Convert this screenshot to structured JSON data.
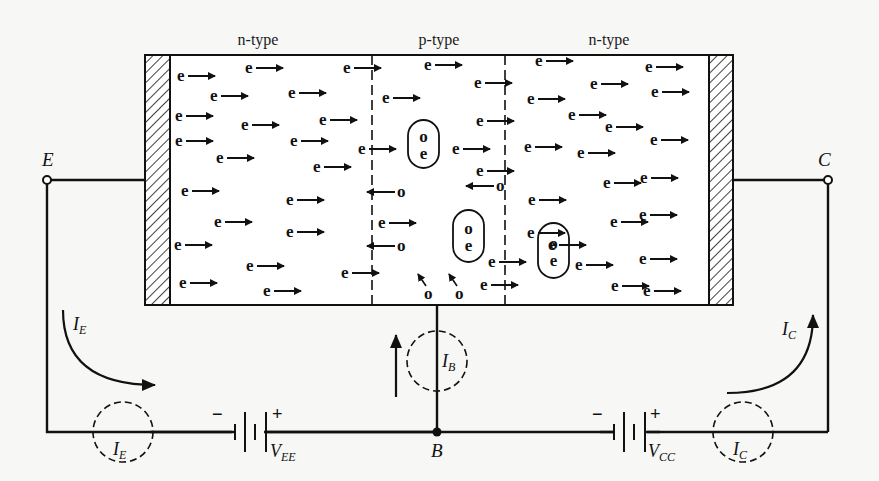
{
  "regions": [
    {
      "label": "n-type",
      "role": "emitter",
      "x": 180,
      "labelX": 258
    },
    {
      "label": "p-type",
      "role": "base",
      "x": 370,
      "labelX": 439
    },
    {
      "label": "n-type",
      "role": "collector",
      "x": 505,
      "labelX": 609
    }
  ],
  "terminals": {
    "emitter": {
      "label": "E"
    },
    "collector": {
      "label": "C"
    },
    "base": {
      "label": "B"
    }
  },
  "currents": {
    "emitter": {
      "main": "I",
      "sub": "E"
    },
    "base": {
      "main": "I",
      "sub": "B"
    },
    "collector": {
      "main": "I",
      "sub": "C"
    }
  },
  "batteries": {
    "vee": {
      "main": "V",
      "sub": "EE",
      "minus": "−",
      "plus": "+"
    },
    "vcc": {
      "main": "V",
      "sub": "CC",
      "minus": "−",
      "plus": "+"
    }
  },
  "symbols": {
    "electron": "e",
    "hole": "o"
  },
  "colors": {
    "ink": "#111111",
    "background": "#f7f7f5",
    "block_fill": "#ffffff"
  },
  "electrons_right": [
    [
      177,
      81
    ],
    [
      245,
      73
    ],
    [
      343,
      73
    ],
    [
      424,
      70
    ],
    [
      535,
      66
    ],
    [
      645,
      72
    ],
    [
      210,
      101
    ],
    [
      288,
      98
    ],
    [
      382,
      103
    ],
    [
      474,
      88
    ],
    [
      527,
      104
    ],
    [
      590,
      89
    ],
    [
      651,
      97
    ],
    [
      175,
      121
    ],
    [
      241,
      130
    ],
    [
      319,
      125
    ],
    [
      476,
      126
    ],
    [
      568,
      120
    ],
    [
      175,
      146
    ],
    [
      290,
      146
    ],
    [
      358,
      154
    ],
    [
      452,
      154
    ],
    [
      524,
      152
    ],
    [
      605,
      132
    ],
    [
      650,
      145
    ],
    [
      216,
      163
    ],
    [
      313,
      172
    ],
    [
      476,
      176
    ],
    [
      577,
      158
    ],
    [
      603,
      188
    ],
    [
      181,
      196
    ],
    [
      286,
      205
    ],
    [
      378,
      228
    ],
    [
      528,
      205
    ],
    [
      640,
      183
    ],
    [
      214,
      227
    ],
    [
      286,
      237
    ],
    [
      527,
      238
    ],
    [
      639,
      220
    ],
    [
      174,
      250
    ],
    [
      246,
      271
    ],
    [
      341,
      278
    ],
    [
      488,
      267
    ],
    [
      548,
      250
    ],
    [
      610,
      227
    ],
    [
      179,
      288
    ],
    [
      263,
      296
    ],
    [
      480,
      290
    ],
    [
      575,
      270
    ],
    [
      639,
      264
    ],
    [
      611,
      291
    ],
    [
      643,
      296
    ]
  ],
  "holes_left": [
    [
      397,
      197
    ],
    [
      397,
      251
    ],
    [
      496,
      191
    ]
  ],
  "holes_diag": [
    [
      424,
      294
    ],
    [
      455,
      294
    ]
  ],
  "recombination_pairs": [
    {
      "x": 408,
      "y": 120,
      "w": 31,
      "h": 48
    },
    {
      "x": 453,
      "y": 210,
      "w": 31,
      "h": 52
    },
    {
      "x": 538,
      "y": 223,
      "w": 31,
      "h": 55
    }
  ]
}
